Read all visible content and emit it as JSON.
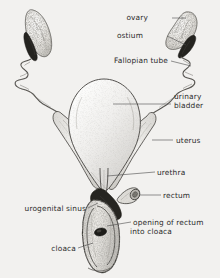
{
  "figure": {
    "background_color": "#f2f1ef",
    "ink_color": "#2b2b2b",
    "style": "pen-and-ink stipple anatomical drawing"
  },
  "labels": [
    {
      "id": "ovary",
      "text": "ovary",
      "lines": [
        "ovary"
      ],
      "side": "right",
      "x": 148,
      "y": 20
    },
    {
      "id": "ostium",
      "text": "ostium",
      "lines": [
        "ostium"
      ],
      "side": "right",
      "x": 143,
      "y": 38
    },
    {
      "id": "fallopian-tube",
      "text": "Fallopian tube",
      "lines": [
        "Fallopian tube"
      ],
      "side": "right",
      "x": 93,
      "y": 63
    },
    {
      "id": "urinary-bladder",
      "text": "urinary bladder",
      "lines": [
        "urinary",
        "bladder"
      ],
      "side": "right",
      "x": 174,
      "y": 96
    },
    {
      "id": "uterus",
      "text": "uterus",
      "lines": [
        "uterus"
      ],
      "side": "right",
      "x": 176,
      "y": 142
    },
    {
      "id": "urethra",
      "text": "urethra",
      "lines": [
        "urethra"
      ],
      "side": "right",
      "x": 157,
      "y": 173
    },
    {
      "id": "rectum",
      "text": "rectum",
      "lines": [
        "rectum"
      ],
      "side": "right",
      "x": 163,
      "y": 196
    },
    {
      "id": "opening-of-rectum",
      "text": "opening of rectum into cloaca",
      "lines": [
        "opening of rectum",
        "into cloaca"
      ],
      "side": "right",
      "x": 133,
      "y": 222
    },
    {
      "id": "urogenital-sinus",
      "text": "urogenital sinus",
      "lines": [
        "urogenital sinus"
      ],
      "side": "left",
      "x": 86,
      "y": 210
    },
    {
      "id": "cloaca",
      "text": "cloaca",
      "lines": [
        "cloaca"
      ],
      "side": "left",
      "x": 76,
      "y": 250
    }
  ],
  "structures": [
    {
      "id": "ovary-left",
      "name": "left ovary",
      "description": "elongated lobulated stippled mass, upper left"
    },
    {
      "id": "ovary-right",
      "name": "right ovary",
      "description": "elongated lobulated stippled mass, upper right"
    },
    {
      "id": "ostium-right",
      "name": "right ostium",
      "description": "dark slit-like funnel opening below right ovary"
    },
    {
      "id": "ostium-left",
      "name": "left ostium",
      "description": "dark slit-like funnel opening below left ovary"
    },
    {
      "id": "fallopian-tube-left",
      "name": "left Fallopian tube",
      "description": "coiled convoluted tube descending from left ostium"
    },
    {
      "id": "fallopian-tube-right",
      "name": "right Fallopian tube",
      "description": "coiled convoluted tube descending from right ostium"
    },
    {
      "id": "urinary-bladder",
      "name": "urinary bladder",
      "description": "large pear-shaped sac in the centre"
    },
    {
      "id": "uterus-left",
      "name": "left uterus",
      "description": "broad tapering horn converging to midline"
    },
    {
      "id": "uterus-right",
      "name": "right uterus",
      "description": "broad tapering horn converging to midline"
    },
    {
      "id": "urethra",
      "name": "urethra",
      "description": "narrow central duct from bladder neck"
    },
    {
      "id": "rectum",
      "name": "rectum",
      "description": "short cut-off tube stub entering from the right"
    },
    {
      "id": "urogenital-sinus",
      "name": "urogenital sinus",
      "description": "dark triangular chamber above the cloaca"
    },
    {
      "id": "cloaca",
      "name": "cloaca",
      "description": "opened elongated chamber, lower midline"
    },
    {
      "id": "rectal-opening",
      "name": "opening of rectum into cloaca",
      "description": "dark oval aperture inside the cloaca"
    }
  ]
}
